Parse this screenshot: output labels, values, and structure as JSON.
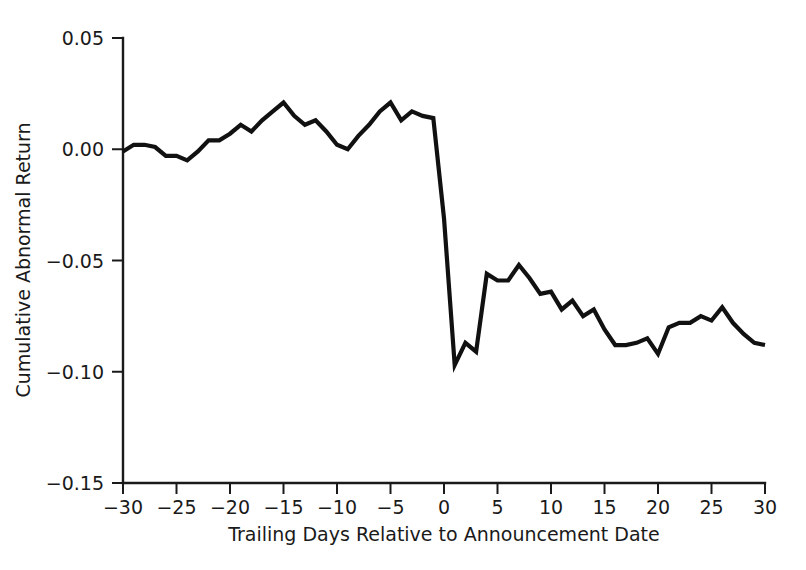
{
  "chart_data": {
    "type": "line",
    "title": "",
    "xlabel": "Trailing Days Relative to Announcement Date",
    "ylabel": "Cumulative Abnormal Return",
    "xlim": [
      -30,
      30
    ],
    "ylim": [
      -0.15,
      0.05
    ],
    "xticks": [
      -30,
      -25,
      -20,
      -15,
      -10,
      -5,
      0,
      5,
      10,
      15,
      20,
      25,
      30
    ],
    "yticks": [
      0.05,
      0.0,
      -0.05,
      -0.1,
      -0.15
    ],
    "xtick_labels": [
      "−30",
      "−25",
      "−20",
      "−15",
      "−10",
      "−5",
      "0",
      "5",
      "10",
      "15",
      "20",
      "25",
      "30"
    ],
    "ytick_labels": [
      "0.05",
      "0.00",
      "−0.05",
      "−0.10",
      "−0.15"
    ],
    "grid": false,
    "legend": "none",
    "line_color": "#111111",
    "background_color": "#ffffff",
    "series": [
      {
        "name": "Cumulative Abnormal Return",
        "x": [
          -30,
          -29,
          -28,
          -27,
          -26,
          -25,
          -24,
          -23,
          -22,
          -21,
          -20,
          -19,
          -18,
          -17,
          -16,
          -15,
          -14,
          -13,
          -12,
          -11,
          -10,
          -9,
          -8,
          -7,
          -6,
          -5,
          -4,
          -3,
          -2,
          -1,
          0,
          1,
          2,
          3,
          4,
          5,
          6,
          7,
          8,
          9,
          10,
          11,
          12,
          13,
          14,
          15,
          16,
          17,
          18,
          19,
          20,
          21,
          22,
          23,
          24,
          25,
          26,
          27,
          28,
          29,
          30
        ],
        "values": [
          -0.001,
          0.002,
          0.002,
          0.001,
          -0.003,
          -0.003,
          -0.005,
          -0.001,
          0.004,
          0.004,
          0.007,
          0.011,
          0.008,
          0.013,
          0.017,
          0.021,
          0.015,
          0.011,
          0.013,
          0.008,
          0.002,
          0.0,
          0.006,
          0.011,
          0.017,
          0.021,
          0.013,
          0.017,
          0.015,
          0.014,
          -0.031,
          -0.097,
          -0.087,
          -0.091,
          -0.056,
          -0.059,
          -0.059,
          -0.052,
          -0.058,
          -0.065,
          -0.064,
          -0.072,
          -0.068,
          -0.075,
          -0.072,
          -0.081,
          -0.088,
          -0.088,
          -0.087,
          -0.085,
          -0.092,
          -0.08,
          -0.078,
          -0.078,
          -0.075,
          -0.077,
          -0.071,
          -0.078,
          -0.083,
          -0.087,
          -0.088
        ]
      }
    ]
  }
}
